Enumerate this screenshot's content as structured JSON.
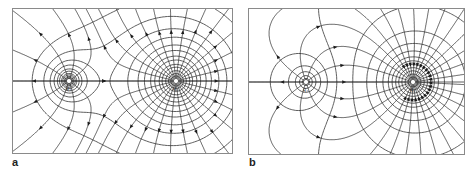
{
  "figure": {
    "panels": [
      {
        "id": "a",
        "label": "a",
        "description": "Field lines and equipotentials of two like (positive) charges of unequal magnitude",
        "charges": [
          {
            "name": "small-charge",
            "label": "q₁",
            "x": 56,
            "y": 72,
            "relative_strength": 1
          },
          {
            "name": "large-charge",
            "label": "q₂",
            "x": 163,
            "y": 72,
            "relative_strength": 4
          }
        ],
        "field_direction": "outward"
      },
      {
        "id": "b",
        "label": "b",
        "description": "Field lines and equipotentials of two unlike charges of unequal magnitude",
        "charges": [
          {
            "name": "small-charge",
            "label": "q₁",
            "x": 57,
            "y": 73,
            "relative_strength": 1
          },
          {
            "name": "large-charge",
            "label": "q₂",
            "x": 164,
            "y": 73,
            "relative_strength": -4
          }
        ],
        "field_direction": "from small charge toward large charge"
      }
    ]
  }
}
